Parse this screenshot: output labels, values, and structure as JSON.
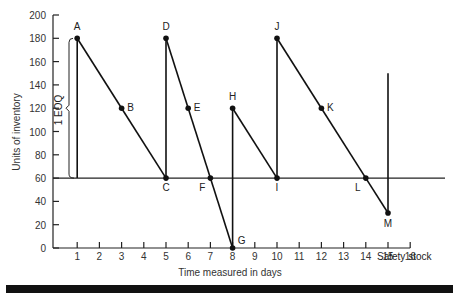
{
  "chart_data": {
    "type": "line",
    "title": "",
    "xlabel": "Time measured in days",
    "ylabel": "Units of inventory",
    "xlim": [
      0,
      16
    ],
    "ylim": [
      0,
      200
    ],
    "x_ticks": [
      1,
      2,
      3,
      4,
      5,
      6,
      7,
      8,
      9,
      10,
      11,
      12,
      13,
      14,
      15,
      16
    ],
    "y_ticks": [
      0,
      20,
      40,
      60,
      80,
      100,
      120,
      140,
      160,
      180,
      200
    ],
    "grid": false,
    "series": [
      {
        "name": "Inventory level",
        "points": [
          {
            "label": "A",
            "x": 1,
            "y": 180
          },
          {
            "label": "B",
            "x": 3,
            "y": 120
          },
          {
            "label": "C",
            "x": 5,
            "y": 60
          },
          {
            "label": "D",
            "x": 5,
            "y": 180
          },
          {
            "label": "E",
            "x": 6,
            "y": 120
          },
          {
            "label": "F",
            "x": 7,
            "y": 60
          },
          {
            "label": "G",
            "x": 8,
            "y": 0
          },
          {
            "label": "H",
            "x": 8,
            "y": 120
          },
          {
            "label": "I",
            "x": 10,
            "y": 60
          },
          {
            "label": "J",
            "x": 10,
            "y": 180
          },
          {
            "label": "K",
            "x": 12,
            "y": 120
          },
          {
            "label": "L",
            "x": 14,
            "y": 60
          },
          {
            "label": "M",
            "x": 15,
            "y": 30
          }
        ]
      }
    ],
    "vertical_lines": [
      {
        "x": 1,
        "y0": 60,
        "y1": 180
      },
      {
        "x": 5,
        "y0": 60,
        "y1": 180
      },
      {
        "x": 8,
        "y0": 0,
        "y1": 120
      },
      {
        "x": 10,
        "y0": 60,
        "y1": 180
      },
      {
        "x": 15,
        "y0": 30,
        "y1": 150
      }
    ],
    "reference_lines": [
      {
        "y": 60,
        "label": "Safety stock"
      }
    ],
    "annotations": [
      {
        "text": "1 EOQ",
        "type": "brace",
        "x": 0.7,
        "y0": 60,
        "y1": 180
      }
    ]
  },
  "labels": {
    "xlabel": "Time measured in days",
    "ylabel": "Units of inventory",
    "safety": "Safety stock",
    "eoq": "1 EOQ"
  }
}
